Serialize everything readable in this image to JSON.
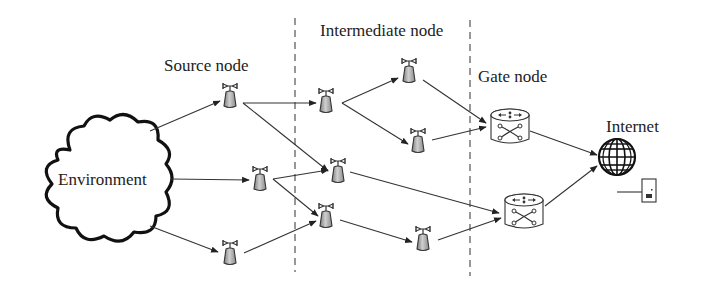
{
  "labels": {
    "source": "Source node",
    "intermediate": "Intermediate node",
    "gate": "Gate node",
    "internet": "Internet",
    "environment": "Environment"
  },
  "colors": {
    "line": "#333333",
    "dash": "#444444",
    "tower_body": "#9a9a9a",
    "tower_body_light": "#d0d0d0",
    "router_fill": "#ffffff",
    "text": "#222222"
  },
  "nodes": {
    "source": [
      {
        "id": "S1",
        "x": 230,
        "y": 98
      },
      {
        "id": "S2",
        "x": 260,
        "y": 181
      },
      {
        "id": "S3",
        "x": 230,
        "y": 255
      }
    ],
    "intermediate": [
      {
        "id": "I1",
        "x": 326,
        "y": 103
      },
      {
        "id": "I2",
        "x": 409,
        "y": 73
      },
      {
        "id": "I3",
        "x": 418,
        "y": 143
      },
      {
        "id": "I4",
        "x": 338,
        "y": 173
      },
      {
        "id": "I5",
        "x": 326,
        "y": 218
      },
      {
        "id": "I6",
        "x": 423,
        "y": 241
      }
    ],
    "gate": [
      {
        "id": "G1",
        "x": 510,
        "y": 127
      },
      {
        "id": "G2",
        "x": 524,
        "y": 212
      }
    ],
    "internet": {
      "id": "NET",
      "x": 617,
      "y": 157
    }
  },
  "edges": [
    [
      "ENV",
      "S1"
    ],
    [
      "ENV",
      "S2"
    ],
    [
      "ENV",
      "S3"
    ],
    [
      "S1",
      "I1"
    ],
    [
      "S1",
      "I4"
    ],
    [
      "S2",
      "I3"
    ],
    [
      "S2",
      "I5"
    ],
    [
      "S3",
      "I5"
    ],
    [
      "I1",
      "I2"
    ],
    [
      "I1",
      "I3"
    ],
    [
      "I2",
      "G1"
    ],
    [
      "I3",
      "G1"
    ],
    [
      "I4",
      "G2"
    ],
    [
      "I5",
      "I6"
    ],
    [
      "I6",
      "G2"
    ],
    [
      "G1",
      "NET"
    ],
    [
      "G2",
      "NET"
    ]
  ]
}
